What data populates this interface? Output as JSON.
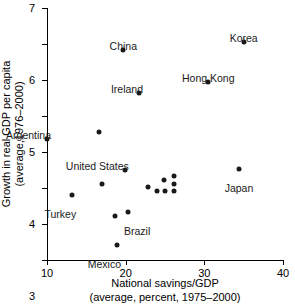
{
  "chart_data": {
    "type": "scatter",
    "title": "",
    "xlabel": "National savings/GDP",
    "xlabel_sub": "(average, percent, 1975–2000)",
    "ylabel": "Growth in real GDP per capita",
    "ylabel_sub": "(average,1976–2000)",
    "xlim": [
      10,
      40
    ],
    "ylim": [
      0,
      7
    ],
    "xticks": [
      10,
      20,
      30,
      40
    ],
    "yticks": [
      0,
      1,
      2,
      3,
      4,
      5,
      6,
      7
    ],
    "xtick_labels": [
      "10",
      "20",
      "30",
      "40"
    ],
    "ytick_labels": [
      "0",
      "1",
      "2",
      "3",
      "4",
      "5",
      "6",
      "7"
    ],
    "grid": false,
    "legend": "none",
    "marker": "filled-circle",
    "marker_color": "#1a1a1a",
    "points": [
      {
        "label": "Argentina",
        "x": 10.0,
        "y": 3.35
      },
      {
        "label": "",
        "x": 16.6,
        "y": 3.55
      },
      {
        "label": "China",
        "x": 19.7,
        "y": 5.83
      },
      {
        "label": "Ireland",
        "x": 21.7,
        "y": 4.63
      },
      {
        "label": "Korea",
        "x": 35.0,
        "y": 6.05
      },
      {
        "label": "Hong Kong",
        "x": 30.5,
        "y": 4.94
      },
      {
        "label": "Japan",
        "x": 34.4,
        "y": 2.54
      },
      {
        "label": "United States",
        "x": 19.9,
        "y": 2.5
      },
      {
        "label": "",
        "x": 17.0,
        "y": 2.12
      },
      {
        "label": "",
        "x": 22.9,
        "y": 2.04
      },
      {
        "label": "",
        "x": 24.0,
        "y": 1.92
      },
      {
        "label": "",
        "x": 24.9,
        "y": 2.21
      },
      {
        "label": "",
        "x": 25.0,
        "y": 1.91
      },
      {
        "label": "",
        "x": 26.2,
        "y": 2.33
      },
      {
        "label": "",
        "x": 26.2,
        "y": 2.11
      },
      {
        "label": "",
        "x": 26.2,
        "y": 1.91
      },
      {
        "label": "Turkey",
        "x": 13.2,
        "y": 1.81
      },
      {
        "label": "Brazil",
        "x": 20.3,
        "y": 1.32
      },
      {
        "label": "",
        "x": 18.7,
        "y": 1.21
      },
      {
        "label": "Mexico",
        "x": 18.9,
        "y": 0.43
      }
    ],
    "annotations": [
      {
        "text": "Argentina",
        "x": 10.0,
        "y": 3.35,
        "pos": "above-left"
      },
      {
        "text": "China",
        "x": 19.7,
        "y": 5.83,
        "pos": "above"
      },
      {
        "text": "Ireland",
        "x": 21.7,
        "y": 4.63,
        "pos": "above-left"
      },
      {
        "text": "Korea",
        "x": 35.0,
        "y": 6.05,
        "pos": "above"
      },
      {
        "text": "Hong Kong",
        "x": 30.5,
        "y": 4.94,
        "pos": "above"
      },
      {
        "text": "Japan",
        "x": 34.4,
        "y": 2.54,
        "pos": "below"
      },
      {
        "text": "United States",
        "x": 19.9,
        "y": 2.5,
        "pos": "above-left"
      },
      {
        "text": "Turkey",
        "x": 13.2,
        "y": 1.81,
        "pos": "below-left"
      },
      {
        "text": "Brazil",
        "x": 20.3,
        "y": 1.32,
        "pos": "below-right"
      },
      {
        "text": "Mexico",
        "x": 18.9,
        "y": 0.43,
        "pos": "below-left"
      }
    ]
  }
}
